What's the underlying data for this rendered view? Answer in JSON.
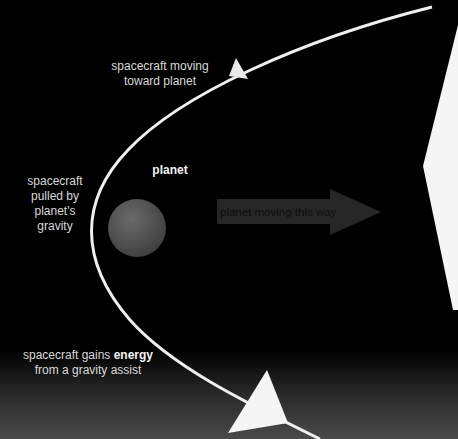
{
  "diagram": {
    "title": "Gravity assist",
    "labels": {
      "approach": [
        "spacecraft moving",
        "toward planet"
      ],
      "pull": [
        "spacecraft",
        "pulled by",
        "planet's",
        "gravity"
      ],
      "planet": "planet",
      "motion_arrow": "planet moving this way",
      "gain_prefix": "spacecraft gains ",
      "gain_bold": "energy",
      "gain_suffix": "from a gravity assist"
    },
    "colors": {
      "background": "#000000",
      "trajectory": "#f0f0f0",
      "planet": "#555555",
      "motion_arrow": "#262626",
      "motion_arrow_text": "#0f0f0f",
      "spacecraft_shape": "#f5f5f5"
    }
  }
}
